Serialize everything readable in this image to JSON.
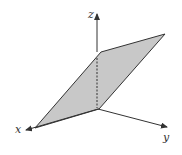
{
  "diagram": {
    "type": "3d-coordinate-plane",
    "axes": {
      "x": {
        "label": "x"
      },
      "y": {
        "label": "y"
      },
      "z": {
        "label": "z"
      }
    },
    "plane": {
      "fill": "#c8c8c8",
      "stroke": "#333333",
      "description": "shaded parallelogram plane containing the z-axis direction, extending along x and y"
    },
    "colors": {
      "axis": "#333333",
      "background": "#ffffff"
    }
  }
}
